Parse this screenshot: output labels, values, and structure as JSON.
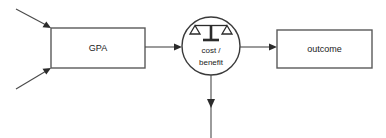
{
  "diagram": {
    "background_color": "#ffffff",
    "width": 386,
    "height": 138,
    "nodes": {
      "gpa": {
        "label": "GPA",
        "shape": "rectangle",
        "x": 51,
        "y": 28,
        "width": 94,
        "height": 40,
        "stroke_color": "#5a5a5a",
        "fill_color": "#ffffff"
      },
      "cost_benefit": {
        "label_line1": "cost /",
        "label_line2": "benefit",
        "icon": "balance-scale-icon",
        "shape": "circle",
        "cx": 211,
        "cy": 46,
        "r": 29,
        "stroke_color": "#3a3a3a",
        "fill_color": "#ffffff"
      },
      "outcome": {
        "label": "outcome",
        "shape": "rectangle",
        "x": 277,
        "y": 30,
        "width": 95,
        "height": 38,
        "stroke_color": "#5a5a5a",
        "fill_color": "#ffffff"
      }
    },
    "edges": [
      {
        "name": "input-arrow-top",
        "from_x": 16,
        "from_y": 9,
        "to_x": 51,
        "to_y": 28,
        "label": "",
        "arrowhead": "filled"
      },
      {
        "name": "input-arrow-bottom",
        "from_x": 16,
        "from_y": 89,
        "to_x": 51,
        "to_y": 68,
        "label": "",
        "arrowhead": "filled"
      },
      {
        "name": "gpa-to-cost-benefit",
        "from_x": 145,
        "from_y": 47,
        "to_x": 182,
        "to_y": 47,
        "label": "",
        "arrowhead": "filled"
      },
      {
        "name": "cost-benefit-to-outcome",
        "from_x": 240,
        "from_y": 47,
        "to_x": 277,
        "to_y": 47,
        "label": "",
        "arrowhead": "filled"
      },
      {
        "name": "cost-benefit-output-down",
        "from_x": 211,
        "from_y": 75,
        "to_x": 211,
        "to_y": 138,
        "label": "",
        "arrowhead": "filled"
      }
    ],
    "colors": {
      "stroke": "#4a4a4a",
      "arrow": "#2b2b2b",
      "text": "#1a1a1a",
      "background": "#ffffff"
    }
  }
}
